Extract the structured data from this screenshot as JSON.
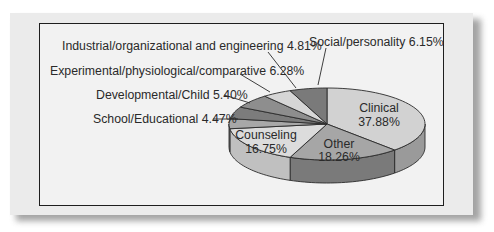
{
  "chart_data": {
    "type": "pie",
    "style": "3d-pie",
    "title": "",
    "start_angle_deg": 90,
    "direction": "clockwise",
    "slices": [
      {
        "label": "Clinical",
        "value": 37.88,
        "display": "37.88%",
        "color": "#d2d2d2",
        "side_color": "#9a9a9a"
      },
      {
        "label": "Other",
        "value": 18.26,
        "display": "18.26%",
        "color": "#a6a6a6",
        "side_color": "#7a7a7a"
      },
      {
        "label": "Counseling",
        "value": 16.75,
        "display": "16.75%",
        "color": "#dcdcdc",
        "side_color": "#c0c0c0"
      },
      {
        "label": "School/Educational",
        "value": 4.47,
        "display": "4.47%",
        "color": "#a8a8a8",
        "side_color": "#909090"
      },
      {
        "label": "Developmental/Child",
        "value": 5.4,
        "display": "5.40%",
        "color": "#7c7c7c",
        "side_color": "#6a6a6a"
      },
      {
        "label": "Experimental/physiological/comparative",
        "value": 6.28,
        "display": "6.28%",
        "color": "#8e8e8e",
        "side_color": "#767676"
      },
      {
        "label": "Industrial/organizational and engineering",
        "value": 4.81,
        "display": "4.81%",
        "color": "#d6d6d6",
        "side_color": "#b0b0b0"
      },
      {
        "label": "Social/personality",
        "value": 6.15,
        "display": "6.15%",
        "color": "#7a7a7a",
        "side_color": "#666666"
      }
    ],
    "legend": "none (callout labels)"
  },
  "labels": {
    "clinical_name": "Clinical",
    "clinical_pct": "37.88%",
    "other_name": "Other",
    "other_pct": "18.26%",
    "counseling_name": "Counseling",
    "counseling_pct": "16.75%",
    "school": "School/Educational 4.47%",
    "developmental": "Developmental/Child 5.40%",
    "experimental": "Experimental/physiological/comparative 6.28%",
    "industrial": "Industrial/organizational and engineering 4.81%",
    "social": "Social/personality 6.15%"
  }
}
